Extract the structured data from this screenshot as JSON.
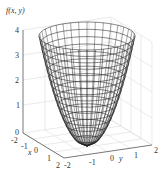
{
  "chart_data": {
    "type": "surface",
    "title": "",
    "function": "f(x,y) = x^2 + y^2",
    "zlabel": "f(x, y)",
    "xlabel": "x",
    "ylabel": "y",
    "x_ticks": [
      "-2",
      "-1",
      "0",
      "1",
      "2"
    ],
    "y_ticks": [
      "-2",
      "-1",
      "0",
      "1",
      "2"
    ],
    "z_ticks": [
      "0",
      "1",
      "2",
      "3",
      "4"
    ],
    "xlim": [
      -2,
      2
    ],
    "ylim": [
      -2,
      2
    ],
    "zlim": [
      0,
      4
    ],
    "grid": true,
    "style": "wireframe mesh, black lines on white",
    "surface": "paraboloid opening upward, vertex at (0,0,0), rim at z=4"
  },
  "labels": {
    "zlabel": "f(x, y)",
    "xlabel": "x",
    "ylabel": "y",
    "z": [
      "0",
      "1",
      "2",
      "3",
      "4"
    ],
    "x": [
      "-2",
      "-1",
      "0",
      "1",
      "2"
    ],
    "y": [
      "-2",
      "-1",
      "0",
      "1",
      "2"
    ]
  },
  "colors": {
    "mesh": "#222222",
    "grid": "#d8d8d8",
    "axis": "#555555"
  }
}
